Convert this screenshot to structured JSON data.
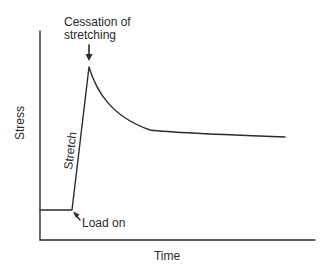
{
  "diagram": {
    "type": "stress-relaxation curve",
    "axes": {
      "y_label": "Stress",
      "x_label": "Time"
    },
    "annotations": {
      "cessation_line1": "Cessation of",
      "cessation_line2": "stretching",
      "load_on": "Load on",
      "stretch": "Stretch"
    },
    "colors": {
      "line": "#2b2b2b",
      "text": "#2a2a2a",
      "background": "#ffffff"
    }
  }
}
